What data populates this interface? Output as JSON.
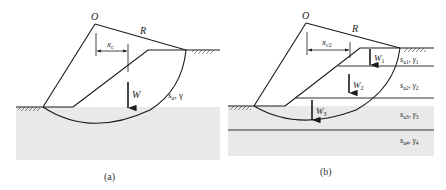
{
  "figure": {
    "panels": [
      {
        "id": "a",
        "caption": "(a)",
        "labels": {
          "center": "O",
          "radius": "R",
          "moment_arm": "x",
          "moment_arm_sub": "c",
          "weight": "W",
          "soil": "s",
          "soil_sub": "u",
          "soil_rest": ", γ"
        }
      },
      {
        "id": "b",
        "caption": "(b)",
        "labels": {
          "center": "O",
          "radius": "R",
          "moment_arm": "x",
          "moment_arm_sub": "c2",
          "weights": [
            {
              "main": "W",
              "sub": "1"
            },
            {
              "main": "W",
              "sub": "2"
            },
            {
              "main": "W",
              "sub": "3"
            }
          ],
          "layers": [
            {
              "s": "s",
              "s_sub": "u1",
              "g": "γ",
              "g_sub": "1"
            },
            {
              "s": "s",
              "s_sub": "u2",
              "g": "γ",
              "g_sub": "2"
            },
            {
              "s": "s",
              "s_sub": "u3",
              "g": "γ",
              "g_sub": "3"
            },
            {
              "s": "s",
              "s_sub": "u4",
              "g": "γ",
              "g_sub": "4"
            }
          ]
        }
      }
    ],
    "colors": {
      "ground_fill": "#e8e8e8",
      "line": "#1a1a1a"
    }
  }
}
